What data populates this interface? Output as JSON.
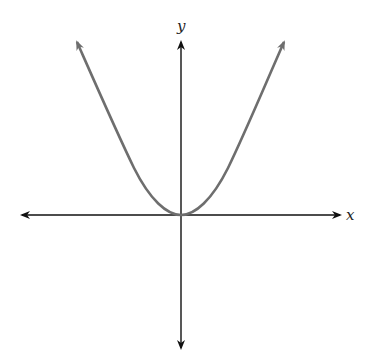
{
  "diagram": {
    "type": "parabola-graph",
    "equation_shape": "y = x^2 (upward-opening parabola, vertex at origin)",
    "axes": {
      "x_label": "x",
      "y_label": "y"
    },
    "colors": {
      "axis": "#111111",
      "curve": "#6e6e6e",
      "background": "#ffffff"
    }
  }
}
